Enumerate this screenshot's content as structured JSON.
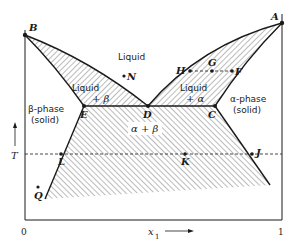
{
  "figure": {
    "type": "binary eutectic phase diagram",
    "axes": {
      "y_label": "T",
      "x_label": "x",
      "x_label_subscript": "1",
      "x_min_label": "0",
      "x_max_label": "1"
    },
    "region_labels": {
      "liquid": "Liquid",
      "liquid_beta_line1": "Liquid",
      "liquid_beta_line2": "+ β",
      "liquid_alpha_line1": "Liquid",
      "liquid_alpha_line2": "+ α",
      "beta_phase_line1": "β-phase",
      "beta_phase_line2": "(solid)",
      "alpha_phase_line1": "α-phase",
      "alpha_phase_line2": "(solid)",
      "alpha_beta": "α + β"
    },
    "points": {
      "A": "A",
      "B": "B",
      "C": "C",
      "D": "D",
      "E": "E",
      "F": "F",
      "G": "G",
      "H": "H",
      "J": "J",
      "K": "K",
      "L": "L",
      "N": "N",
      "Q": "Q"
    },
    "colors": {
      "line": "#1a1a1a",
      "hatch": "#555555",
      "background": "#ffffff"
    }
  }
}
